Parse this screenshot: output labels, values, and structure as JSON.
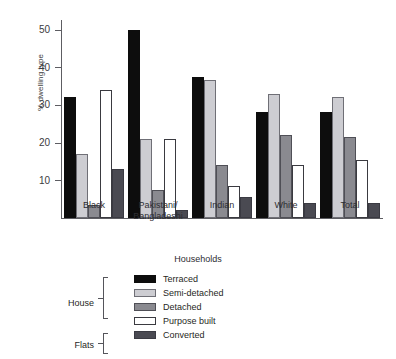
{
  "chart_data": {
    "type": "bar",
    "title": "",
    "xlabel": "Households",
    "ylabel": "% dwelling type",
    "ylim": [
      0,
      52
    ],
    "yticks": [
      10,
      20,
      30,
      40,
      50
    ],
    "ytick_labels": [
      "10",
      "20",
      "30",
      "40",
      "50"
    ],
    "grid": false,
    "legend_position": "below-left",
    "categories": [
      "Black",
      "Pakistani/ Bangladeshi",
      "Indian",
      "White",
      "Total"
    ],
    "category_lines": [
      [
        "Black"
      ],
      [
        "Pakistani/",
        "Bangladeshi"
      ],
      [
        "Indian"
      ],
      [
        "White"
      ],
      [
        "Total"
      ]
    ],
    "series": [
      {
        "name": "Terraced",
        "group": "House",
        "color": "#0d0d0d",
        "values": [
          32,
          50,
          37.5,
          28,
          28
        ]
      },
      {
        "name": "Semi-detached",
        "group": "House",
        "color": "#cdcdd2",
        "values": [
          17,
          21,
          36.5,
          33,
          32
        ]
      },
      {
        "name": "Detached",
        "group": "House",
        "color": "#8a8a90",
        "values": [
          3.5,
          7.5,
          14,
          22,
          21.5
        ]
      },
      {
        "name": "Purpose built",
        "group": "Flats",
        "color": "#ffffff",
        "values": [
          34,
          21,
          8.5,
          14,
          15.5
        ]
      },
      {
        "name": "Converted",
        "group": "Flats",
        "color": "#4a4a52",
        "values": [
          13,
          2,
          5.5,
          4,
          4
        ]
      }
    ]
  },
  "legend": {
    "group_house_label": "House",
    "group_flats_label": "Flats",
    "entries": [
      {
        "label": "Terraced",
        "swatch_class": "bar-terraced"
      },
      {
        "label": "Semi-detached",
        "swatch_class": "bar-semi"
      },
      {
        "label": "Detached",
        "swatch_class": "bar-detached"
      },
      {
        "label": "Purpose built",
        "swatch_class": "bar-purpose"
      },
      {
        "label": "Converted",
        "swatch_class": "bar-converted"
      }
    ]
  }
}
